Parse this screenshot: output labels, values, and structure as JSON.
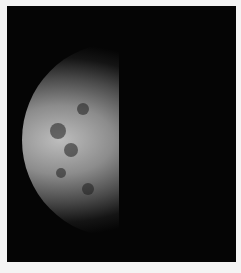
{
  "image": {
    "subject": "Cratered moon, half-illuminated crescent against black space",
    "colors": {
      "background": "#050505",
      "border": "#f4f4f4",
      "lit_surface": "#bdbdbd"
    }
  }
}
